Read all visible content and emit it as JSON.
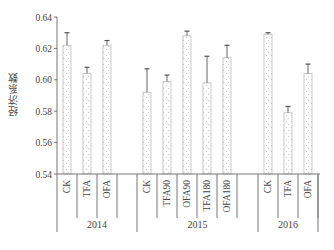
{
  "chart_data": {
    "type": "bar",
    "title": "",
    "xlabel": "",
    "ylabel": "经济系数",
    "ylim": [
      0.54,
      0.64
    ],
    "yticks": [
      "0.54",
      "0.56",
      "0.58",
      "0.60",
      "0.62",
      "0.64"
    ],
    "grid": false,
    "legend": null,
    "pattern": "dotted fill, light gray outline",
    "groups": [
      {
        "year": "2014",
        "categories": [
          "CK",
          "TFA",
          "OFA"
        ],
        "values": [
          0.622,
          0.604,
          0.622
        ],
        "error_upper": [
          0.63,
          0.608,
          0.625
        ]
      },
      {
        "year": "2015",
        "categories": [
          "CK",
          "TFA90",
          "OFA90",
          "TFA180",
          "OFA180"
        ],
        "values": [
          0.592,
          0.599,
          0.628,
          0.598,
          0.614
        ],
        "error_upper": [
          0.607,
          0.603,
          0.631,
          0.615,
          0.622
        ]
      },
      {
        "year": "2016",
        "categories": [
          "CK",
          "TFA",
          "OFA"
        ],
        "values": [
          0.629,
          0.579,
          0.604
        ],
        "error_upper": [
          0.63,
          0.583,
          0.61
        ]
      }
    ]
  }
}
